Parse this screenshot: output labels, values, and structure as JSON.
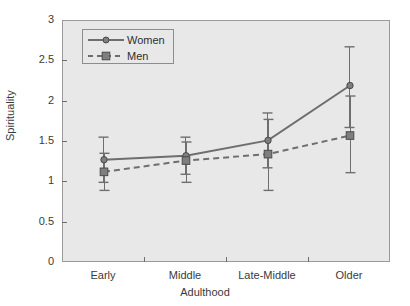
{
  "chart_data": {
    "type": "line",
    "title": "",
    "xlabel": "Adulthood",
    "ylabel": "Spirituality",
    "categories": [
      "Early",
      "Middle",
      "Late-Middle",
      "Older"
    ],
    "ylim": [
      0,
      3
    ],
    "yticks": [
      "0",
      "0.5",
      "1",
      "1.5",
      "2",
      "2.5",
      "3"
    ],
    "ytick_values": [
      0,
      0.5,
      1,
      1.5,
      2,
      2.5,
      3
    ],
    "grid": false,
    "legend_position": "top-left",
    "series": [
      {
        "name": "Women",
        "values": [
          1.28,
          1.33,
          1.52,
          2.2
        ],
        "error_low": [
          1.0,
          1.1,
          1.18,
          1.68
        ],
        "error_high": [
          1.56,
          1.56,
          1.86,
          2.68
        ],
        "line_style": "solid",
        "marker": "circle",
        "color": "#6e6e6e"
      },
      {
        "name": "Men",
        "values": [
          1.13,
          1.27,
          1.35,
          1.58
        ],
        "error_low": [
          0.9,
          1.0,
          0.9,
          1.12
        ],
        "error_high": [
          1.36,
          1.5,
          1.78,
          2.07
        ],
        "line_style": "dashed",
        "marker": "square",
        "color": "#6e6e6e"
      }
    ]
  },
  "axes": {
    "y_title": "Spirituality",
    "x_title": "Adulthood"
  },
  "legend": {
    "items": [
      {
        "label": "Women",
        "marker": "circle-marker",
        "line": "solid-line"
      },
      {
        "label": "Men",
        "marker": "square-marker",
        "line": "dashed-line"
      }
    ]
  },
  "colors": {
    "plot_background": "#e8e8e8",
    "figure_background": "#ffffff",
    "series_line": "#6e6e6e",
    "axis": "#6e6e6e",
    "text": "#3a3a3a"
  }
}
